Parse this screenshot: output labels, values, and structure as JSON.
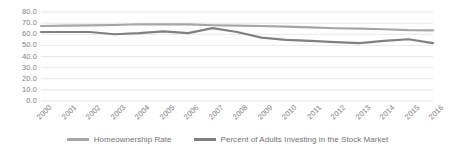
{
  "chart_data": {
    "type": "line",
    "title": "",
    "xlabel": "",
    "ylabel": "",
    "ylim": [
      0,
      80
    ],
    "ytick_step": 10,
    "ytick_labels": [
      "0.0",
      "10.0",
      "20.0",
      "30.0",
      "40.0",
      "50.0",
      "60.0",
      "70.0",
      "80.0"
    ],
    "grid": true,
    "grid_axis": "y",
    "legend_position": "bottom",
    "categories": [
      "2000",
      "2001",
      "2002",
      "2003",
      "2004",
      "2005",
      "2006",
      "2007",
      "2008",
      "2009",
      "2010",
      "2011",
      "2012",
      "2013",
      "2014",
      "2015",
      "2016"
    ],
    "series": [
      {
        "name": "Homeownership Rate",
        "color": "#a6a6a6",
        "values": [
          67.4,
          67.8,
          67.9,
          68.3,
          69.0,
          68.9,
          68.8,
          68.1,
          67.8,
          67.4,
          66.9,
          66.1,
          65.4,
          65.1,
          64.5,
          63.7,
          63.4
        ]
      },
      {
        "name": "Percent of Adults Investing in the Stock Market",
        "color": "#808080",
        "values": [
          62.0,
          62.0,
          62.0,
          60.0,
          61.0,
          62.5,
          61.0,
          65.5,
          62.0,
          57.0,
          55.0,
          54.0,
          53.0,
          52.0,
          54.0,
          55.5,
          52.0
        ]
      }
    ]
  },
  "legend": {
    "items": [
      {
        "label": "Homeownership Rate",
        "color": "#a6a6a6"
      },
      {
        "label": "Percent of Adults Investing in the Stock Market",
        "color": "#808080"
      }
    ]
  },
  "colors": {
    "grid": "#e8e8e8",
    "axis_text": "#808080",
    "legend_text": "#737373",
    "background": "#ffffff"
  }
}
